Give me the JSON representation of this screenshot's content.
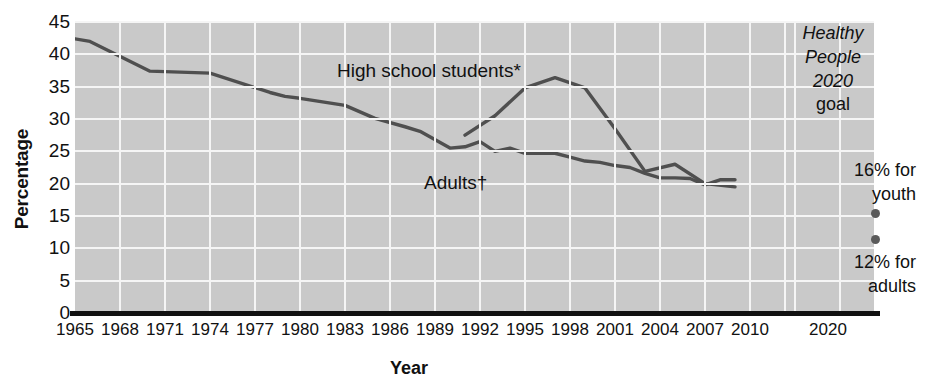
{
  "chart_data": {
    "type": "line",
    "title": "",
    "xlabel": "Year",
    "ylabel": "Percentage",
    "ylim": [
      0,
      45
    ],
    "xlim": [
      1965,
      2010
    ],
    "ytick_labels": [
      "45",
      "40",
      "35",
      "30",
      "25",
      "20",
      "15",
      "10",
      "5",
      "0"
    ],
    "ytick_values": [
      45,
      40,
      35,
      30,
      25,
      20,
      15,
      10,
      5,
      0
    ],
    "xtick_labels": [
      "1965",
      "1968",
      "1971",
      "1974",
      "1977",
      "1980",
      "1983",
      "1986",
      "1989",
      "1992",
      "1995",
      "1998",
      "2001",
      "2004",
      "2007",
      "2010",
      "2020"
    ],
    "xtick_values": [
      1965,
      1968,
      1971,
      1974,
      1977,
      1980,
      1983,
      1986,
      1989,
      1992,
      1995,
      1998,
      2001,
      2004,
      2007,
      2010,
      2020
    ],
    "grid": true,
    "legend_position": "inline-annotations",
    "series": [
      {
        "name": "Adults†",
        "label": "Adults†",
        "color": "#4f4f4f",
        "x": [
          1965,
          1966,
          1970,
          1974,
          1978,
          1979,
          1980,
          1983,
          1985,
          1987,
          1988,
          1990,
          1991,
          1992,
          1993,
          1994,
          1995,
          1997,
          1998,
          1999,
          2000,
          2001,
          2002,
          2003,
          2004,
          2005,
          2006,
          2007,
          2008,
          2009
        ],
        "values": [
          42.4,
          42.0,
          37.4,
          37.1,
          34.1,
          33.5,
          33.2,
          32.1,
          30.1,
          28.8,
          28.1,
          25.5,
          25.7,
          26.5,
          25.0,
          25.5,
          24.7,
          24.7,
          24.1,
          23.5,
          23.3,
          22.8,
          22.5,
          21.6,
          20.9,
          20.9,
          20.8,
          19.8,
          20.6,
          20.6
        ],
        "marker": "none"
      },
      {
        "name": "High school students*",
        "label": "High school students*",
        "color": "#4f4f4f",
        "x": [
          1991,
          1993,
          1995,
          1997,
          1999,
          2001,
          2003,
          2005,
          2007,
          2009
        ],
        "values": [
          27.5,
          30.5,
          34.8,
          36.4,
          34.8,
          28.5,
          21.9,
          23.0,
          20.0,
          19.5
        ],
        "marker": "none"
      }
    ],
    "annotations": [
      {
        "name": "high-school-label",
        "text": "High school students*",
        "x": 1988,
        "y": 39.5
      },
      {
        "name": "adults-label",
        "text": "Adults†",
        "x": 1989.5,
        "y": 21.5
      },
      {
        "name": "goal-title",
        "text": "Healthy People 2020 goal",
        "x": 2020,
        "y": 44
      },
      {
        "name": "goal-youth",
        "text": "16% for youth",
        "x": 2020,
        "y": 17.5
      },
      {
        "name": "goal-adults",
        "text": "12% for adults",
        "x": 2020,
        "y": 9.5
      }
    ],
    "goal_points": [
      {
        "name": "youth-goal-point",
        "label": "16% for youth",
        "x": 2020,
        "value": 16
      },
      {
        "name": "adults-goal-point",
        "label": "12% for adults",
        "x": 2020,
        "value": 12
      }
    ]
  },
  "axes": {
    "y_title": "Percentage",
    "x_title": "Year"
  },
  "labels": {
    "high_school": "High school students*",
    "adults": "Adults†"
  },
  "goal_box": {
    "line1": "Healthy",
    "line2": "People",
    "line3": "2020",
    "line4": "goal"
  },
  "goal_notes": {
    "youth_line1": "16% for",
    "youth_line2": "youth",
    "adults_line1": "12% for",
    "adults_line2": "adults"
  },
  "colors": {
    "plot_background": "#c9c9c9",
    "gridline": "#f5f5f5",
    "line": "#4f4f4f",
    "axis": "#111111",
    "goal_dot": "#5a5a5a"
  }
}
